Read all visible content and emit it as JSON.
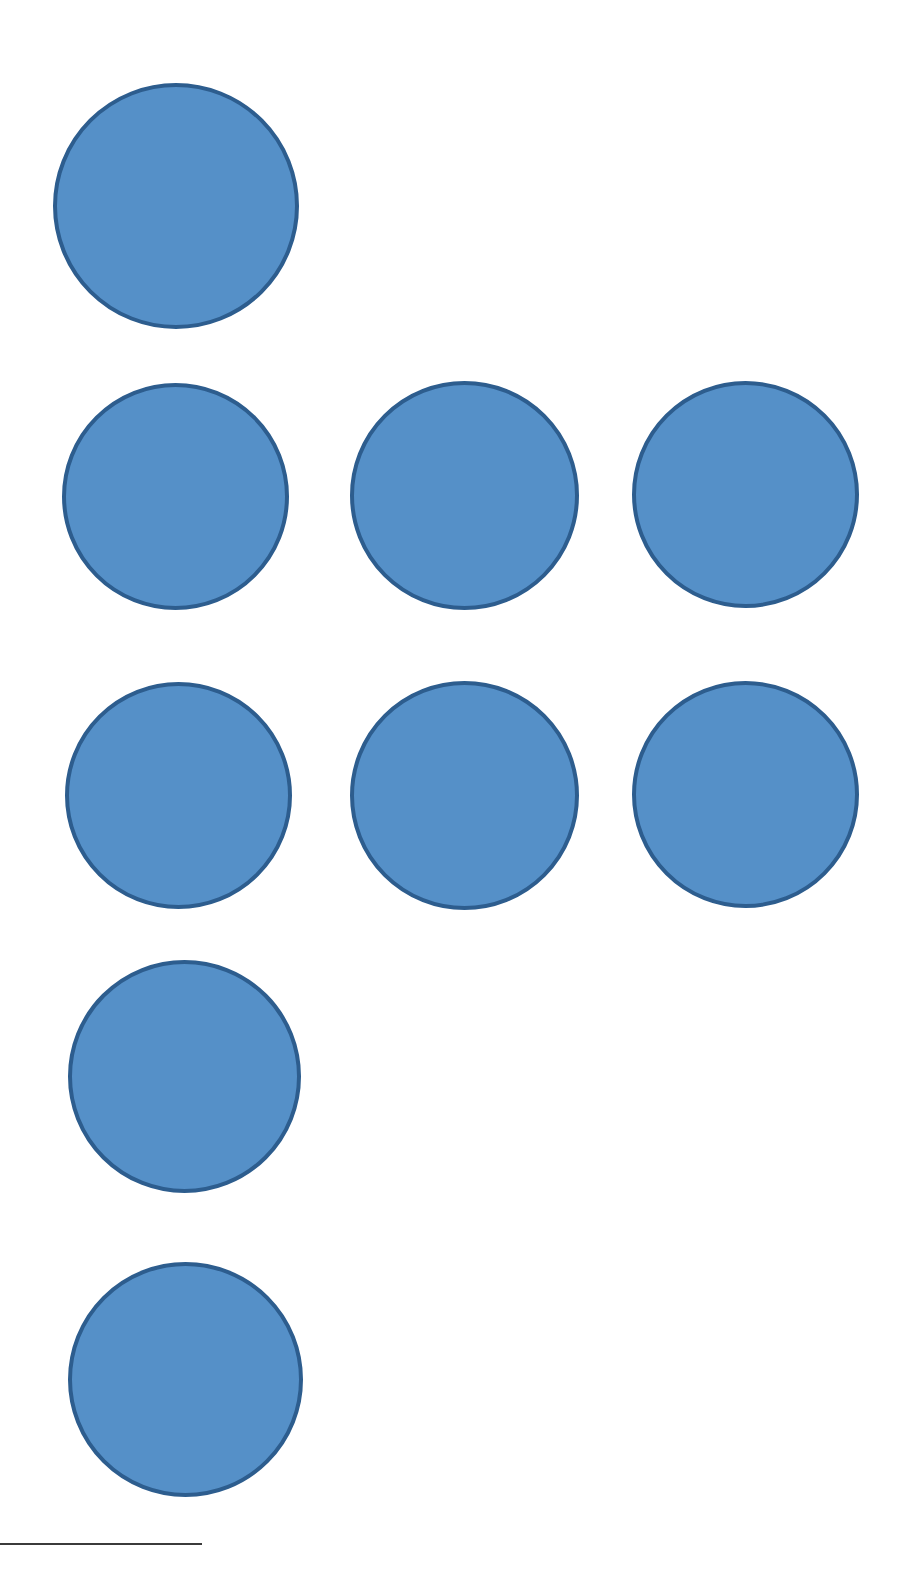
{
  "page": {
    "width": 905,
    "height": 1581,
    "background_color": "#ffffff",
    "kind": "scanned-document-page"
  },
  "figure": {
    "name": "blue-circle-array",
    "mark_count": 9,
    "fill_color": "#5590c8",
    "stroke_color": "#2d5d8e",
    "stroke_width": 4,
    "rows": [
      {
        "row_label": "row-1",
        "count": 1,
        "marks": [
          {
            "label": "circle-1",
            "x": 53,
            "y": 83,
            "size": 246
          }
        ]
      },
      {
        "row_label": "row-2",
        "count": 3,
        "marks": [
          {
            "label": "circle-2",
            "x": 62,
            "y": 383,
            "size": 227
          },
          {
            "label": "circle-3",
            "x": 350,
            "y": 381,
            "size": 229
          },
          {
            "label": "circle-4",
            "x": 632,
            "y": 381,
            "size": 227
          }
        ]
      },
      {
        "row_label": "row-3",
        "count": 3,
        "marks": [
          {
            "label": "circle-5",
            "x": 65,
            "y": 682,
            "size": 227
          },
          {
            "label": "circle-6",
            "x": 350,
            "y": 681,
            "size": 229
          },
          {
            "label": "circle-7",
            "x": 632,
            "y": 681,
            "size": 227
          }
        ]
      },
      {
        "row_label": "row-4",
        "count": 1,
        "marks": [
          {
            "label": "circle-8",
            "x": 68,
            "y": 960,
            "size": 233
          }
        ]
      },
      {
        "row_label": "row-5",
        "count": 1,
        "marks": [
          {
            "label": "circle-9",
            "x": 68,
            "y": 1262,
            "size": 235
          }
        ]
      }
    ]
  },
  "footnote_rule": {
    "name": "footnote-separator",
    "x": 0,
    "y": 1543,
    "width": 202,
    "thickness": 2,
    "color": "#3b3b3b"
  }
}
